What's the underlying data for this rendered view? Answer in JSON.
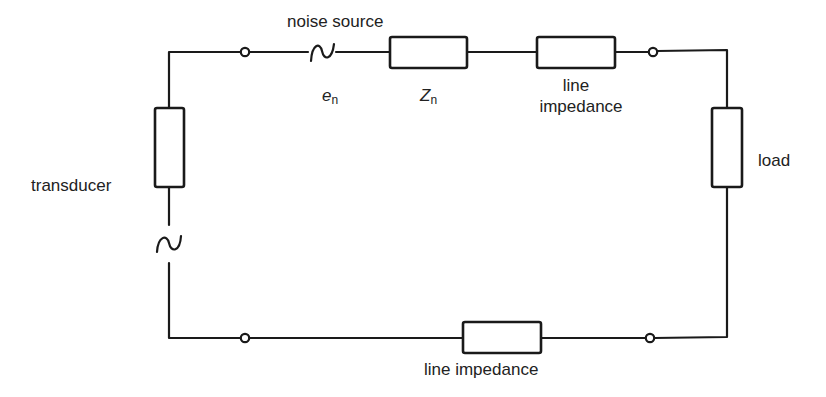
{
  "diagram": {
    "type": "circuit",
    "labels": {
      "noise_source": "noise source",
      "en_symbol": "e",
      "en_subscript": "n",
      "zn_symbol": "Z",
      "zn_subscript": "n",
      "top_line_impedance_line1": "line",
      "top_line_impedance_line2": "impedance",
      "load": "load",
      "transducer": "transducer",
      "bottom_line_impedance": "line impedance"
    },
    "components": [
      {
        "id": "transducer",
        "kind": "impedance+ac-source",
        "label": "transducer"
      },
      {
        "id": "noise-source",
        "kind": "ac-source",
        "label": "noise source",
        "symbol": "en"
      },
      {
        "id": "noise-impedance",
        "kind": "impedance",
        "symbol": "Zn"
      },
      {
        "id": "top-line-impedance",
        "kind": "impedance",
        "label": "line impedance"
      },
      {
        "id": "load",
        "kind": "impedance",
        "label": "load"
      },
      {
        "id": "bottom-line-impedance",
        "kind": "impedance",
        "label": "line impedance"
      }
    ],
    "terminals": 4,
    "colors": {
      "line": "#1a1a1a",
      "background": "#ffffff"
    }
  }
}
